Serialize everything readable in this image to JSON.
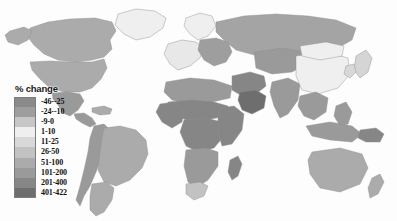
{
  "map": {
    "title": "",
    "projection": "world-equirectangular",
    "ocean_color": "#fdfdfd",
    "border_color": "#8f8f8f",
    "no_data_color": "#f2f2f2"
  },
  "legend": {
    "title": "% change",
    "classes": [
      {
        "label": "-46--25",
        "color": "#8a8a8a",
        "min": -46,
        "max": -25
      },
      {
        "label": "-24--10",
        "color": "#9e9e9e",
        "min": -24,
        "max": -10
      },
      {
        "label": "-9-0",
        "color": "#c6c6c6",
        "min": -9,
        "max": 0
      },
      {
        "label": "1-10",
        "color": "#efefef",
        "min": 1,
        "max": 10
      },
      {
        "label": "11-25",
        "color": "#d8d8d8",
        "min": 11,
        "max": 25
      },
      {
        "label": "26-50",
        "color": "#c2c2c2",
        "min": 26,
        "max": 50
      },
      {
        "label": "51-100",
        "color": "#ababab",
        "min": 51,
        "max": 100
      },
      {
        "label": "101-200",
        "color": "#9a9a9a",
        "min": 101,
        "max": 200
      },
      {
        "label": "201-400",
        "color": "#868686",
        "min": 201,
        "max": 400
      },
      {
        "label": "401-422",
        "color": "#6e6e6e",
        "min": 401,
        "max": 422
      }
    ]
  },
  "chart_data": {
    "type": "heatmap",
    "title": "% change",
    "xlabel": "",
    "ylabel": "",
    "categories": [
      "-46--25",
      "-24--10",
      "-9-0",
      "1-10",
      "11-25",
      "26-50",
      "51-100",
      "101-200",
      "201-400",
      "401-422"
    ],
    "values": [
      -46,
      -24,
      -9,
      1,
      11,
      26,
      51,
      101,
      201,
      401
    ],
    "regions": [
      {
        "name": "Canada",
        "class": "51-100",
        "fill": "#ababab"
      },
      {
        "name": "United States",
        "class": "51-100",
        "fill": "#ababab"
      },
      {
        "name": "Alaska",
        "class": "51-100",
        "fill": "#ababab"
      },
      {
        "name": "Greenland",
        "class": "1-10",
        "fill": "#efefef"
      },
      {
        "name": "Mexico",
        "class": "101-200",
        "fill": "#9a9a9a"
      },
      {
        "name": "Central America",
        "class": "101-200",
        "fill": "#9a9a9a"
      },
      {
        "name": "Caribbean",
        "class": "51-100",
        "fill": "#ababab"
      },
      {
        "name": "Brazil",
        "class": "51-100",
        "fill": "#ababab"
      },
      {
        "name": "Argentina",
        "class": "51-100",
        "fill": "#ababab"
      },
      {
        "name": "Andean states",
        "class": "101-200",
        "fill": "#9a9a9a"
      },
      {
        "name": "Western Europe",
        "class": "-9-0",
        "fill": "#e8e8e8"
      },
      {
        "name": "Scandinavia",
        "class": "1-10",
        "fill": "#efefef"
      },
      {
        "name": "Eastern Europe",
        "class": "-24--10",
        "fill": "#9e9e9e"
      },
      {
        "name": "Russia",
        "class": "-9-0",
        "fill": "#a4a4a4"
      },
      {
        "name": "North Africa",
        "class": "101-200",
        "fill": "#9a9a9a"
      },
      {
        "name": "Sahel",
        "class": "201-400",
        "fill": "#868686"
      },
      {
        "name": "West Africa",
        "class": "201-400",
        "fill": "#868686"
      },
      {
        "name": "Central Africa",
        "class": "201-400",
        "fill": "#868686"
      },
      {
        "name": "East Africa",
        "class": "201-400",
        "fill": "#868686"
      },
      {
        "name": "Southern Africa",
        "class": "101-200",
        "fill": "#9a9a9a"
      },
      {
        "name": "South Africa",
        "class": "26-50",
        "fill": "#c2c2c2"
      },
      {
        "name": "Madagascar",
        "class": "201-400",
        "fill": "#868686"
      },
      {
        "name": "Middle East",
        "class": "201-400",
        "fill": "#868686"
      },
      {
        "name": "Arabian Peninsula",
        "class": "401-422",
        "fill": "#6e6e6e"
      },
      {
        "name": "Central Asia",
        "class": "101-200",
        "fill": "#9a9a9a"
      },
      {
        "name": "India",
        "class": "101-200",
        "fill": "#9a9a9a"
      },
      {
        "name": "China",
        "class": "1-10",
        "fill": "#efefef"
      },
      {
        "name": "Mongolia",
        "class": "1-10",
        "fill": "#efefef"
      },
      {
        "name": "Japan",
        "class": "-9-0",
        "fill": "#d5d5d5"
      },
      {
        "name": "Korea",
        "class": "11-25",
        "fill": "#d8d8d8"
      },
      {
        "name": "Southeast Asia",
        "class": "101-200",
        "fill": "#9a9a9a"
      },
      {
        "name": "Indonesia",
        "class": "101-200",
        "fill": "#9a9a9a"
      },
      {
        "name": "Philippines",
        "class": "101-200",
        "fill": "#9a9a9a"
      },
      {
        "name": "Papua New Guinea",
        "class": "201-400",
        "fill": "#868686"
      },
      {
        "name": "Australia",
        "class": "51-100",
        "fill": "#ababab"
      },
      {
        "name": "New Zealand",
        "class": "51-100",
        "fill": "#ababab"
      }
    ]
  }
}
